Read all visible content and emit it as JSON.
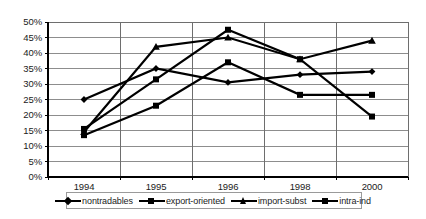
{
  "chart_data": {
    "type": "line",
    "title": "",
    "subtitle": "",
    "xlabel": "",
    "ylabel": "",
    "categories": [
      "1994",
      "1995",
      "1996",
      "1998",
      "2000"
    ],
    "ylim": [
      0,
      50
    ],
    "ytick_labels": [
      "0%",
      "5%",
      "10%",
      "15%",
      "20%",
      "25%",
      "30%",
      "35%",
      "40%",
      "45%",
      "50%"
    ],
    "ytick_values": [
      0,
      5,
      10,
      15,
      20,
      25,
      30,
      35,
      40,
      45,
      50
    ],
    "grid": true,
    "grid_axis": "y",
    "legend_position": "bottom",
    "series": [
      {
        "name": "nontradables",
        "marker": "diamond",
        "color": "#000000",
        "values": [
          25.0,
          35.0,
          30.5,
          33.0,
          34.0
        ]
      },
      {
        "name": "export-oriented",
        "marker": "square",
        "color": "#000000",
        "values": [
          13.5,
          23.0,
          37.0,
          26.5,
          26.5
        ]
      },
      {
        "name": "import-subst",
        "marker": "triangle",
        "color": "#000000",
        "values": [
          14.5,
          42.0,
          45.0,
          38.0,
          44.0
        ]
      },
      {
        "name": "intra-ind",
        "marker": "square",
        "color": "#000000",
        "values": [
          15.5,
          31.5,
          47.5,
          38.0,
          19.5
        ]
      }
    ]
  },
  "legend": {
    "items": [
      {
        "label": "nontradables",
        "marker": "diamond"
      },
      {
        "label": "export-oriented",
        "marker": "square"
      },
      {
        "label": "import-subst",
        "marker": "triangle"
      },
      {
        "label": "intra-ind",
        "marker": "square"
      }
    ]
  },
  "axis": {
    "y_labels": [
      "50%",
      "45%",
      "40%",
      "35%",
      "30%",
      "25%",
      "20%",
      "15%",
      "10%",
      "5%",
      "0%"
    ],
    "x_labels": [
      "1994",
      "1995",
      "1996",
      "1998",
      "2000"
    ]
  }
}
